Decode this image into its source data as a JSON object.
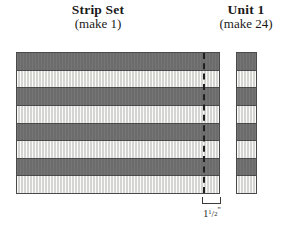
{
  "figures": {
    "strip_set": {
      "title": "Strip Set",
      "subtitle": "(make 1)",
      "strips": [
        {
          "fabric": "dark",
          "color": "#6f6f6f"
        },
        {
          "fabric": "light",
          "color": "#e9e9e6"
        },
        {
          "fabric": "dark",
          "color": "#6f6f6f"
        },
        {
          "fabric": "light",
          "color": "#e9e9e6"
        },
        {
          "fabric": "dark",
          "color": "#6f6f6f"
        },
        {
          "fabric": "light",
          "color": "#e9e9e6"
        },
        {
          "fabric": "dark",
          "color": "#6f6f6f"
        },
        {
          "fabric": "light",
          "color": "#e9e9e6"
        }
      ],
      "strip_count": 8,
      "cut_line": {
        "style": "dashed",
        "color": "#202020"
      }
    },
    "unit": {
      "title": "Unit 1",
      "subtitle": "(make 24)",
      "strips": [
        {
          "fabric": "dark",
          "color": "#6f6f6f"
        },
        {
          "fabric": "light",
          "color": "#e9e9e6"
        },
        {
          "fabric": "dark",
          "color": "#6f6f6f"
        },
        {
          "fabric": "light",
          "color": "#e9e9e6"
        },
        {
          "fabric": "dark",
          "color": "#6f6f6f"
        },
        {
          "fabric": "light",
          "color": "#e9e9e6"
        },
        {
          "fabric": "dark",
          "color": "#6f6f6f"
        },
        {
          "fabric": "light",
          "color": "#e9e9e6"
        }
      ],
      "strip_count": 8
    }
  },
  "dimension": {
    "whole": "1",
    "numerator": "1",
    "slash": "/",
    "denominator": "2",
    "unit_mark": "\"",
    "full_text": "1 1/2\""
  },
  "colors": {
    "dark_fabric": "#6f6f6f",
    "light_fabric": "#e9e9e6",
    "outline": "#4a4a4a",
    "text": "#1a1a1a"
  }
}
